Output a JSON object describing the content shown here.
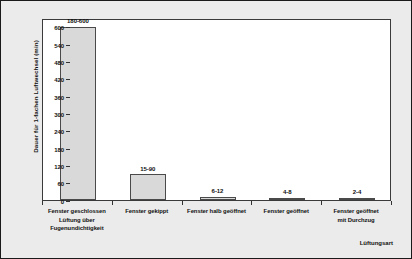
{
  "chart_data": {
    "type": "bar",
    "title": "",
    "xlabel": "Lüftungsart",
    "ylabel": "Dauer für 1-fachen Luftwechsel (min)",
    "categories": [
      "Fenster geschlossen\nLüftung über\nFugenundichtigkeit",
      "Fenster gekippt",
      "Fenster halb geöffnet",
      "Fenster geöffnet",
      "Fenster geöffnet\nmit Durchzug"
    ],
    "category_lines": [
      [
        "Fenster geschlossen",
        "Lüftung über",
        "Fugenundichtigkeit"
      ],
      [
        "Fenster gekippt"
      ],
      [
        "Fenster halb geöffnet"
      ],
      [
        "Fenster geöffnet"
      ],
      [
        "Fenster geöffnet",
        "mit Durchzug"
      ]
    ],
    "values": [
      600,
      90,
      12,
      8,
      4
    ],
    "range_min": [
      180,
      15,
      6,
      4,
      2
    ],
    "range_max": [
      600,
      90,
      12,
      8,
      4
    ],
    "data_labels": [
      "180-600",
      "15-90",
      "6-12",
      "4-8",
      "2-4"
    ],
    "ylim": [
      0,
      630
    ],
    "yticks": [
      0,
      60,
      120,
      180,
      240,
      300,
      360,
      420,
      480,
      540,
      600
    ],
    "ytick_labels": [
      "0",
      "60",
      "120",
      "180",
      "240",
      "300",
      "360",
      "420",
      "480",
      "540",
      "600"
    ],
    "grid": false,
    "legend": false,
    "bar_color": "#d9d9d9",
    "bar_edge_color": "#4a4a4a",
    "plot_background": "#ffffff",
    "figure_background": "#ebebeb",
    "axis_color": "#3a3a3a"
  }
}
